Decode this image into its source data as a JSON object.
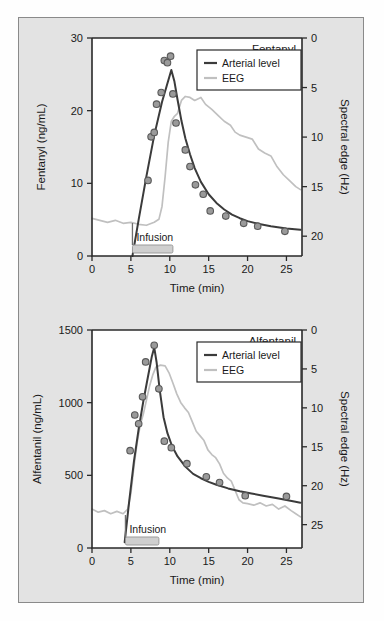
{
  "figure": {
    "background_color": "#e3e3e3",
    "frame_color": "#8a8a8a"
  },
  "colors": {
    "arterial": "#3b3b3b",
    "eeg": "#c0c0c0",
    "point_fill": "#9a9a9a",
    "point_stroke": "#595959",
    "infusion_bar": "#cfcfcf"
  },
  "chart_data": [
    {
      "type": "line",
      "title": "Fentanyl",
      "xlabel": "Time (min)",
      "ylabel": "Fentanyl (ng/mL)",
      "y2label": "Spectral edge (Hz)",
      "xlim": [
        0,
        27
      ],
      "ylim": [
        0,
        30
      ],
      "y2lim": [
        0,
        22
      ],
      "y2_inverted": true,
      "grid": false,
      "legend_position": "top-right",
      "xticks": [
        0,
        5,
        10,
        15,
        20,
        25
      ],
      "yticks": [
        0,
        10,
        20,
        30
      ],
      "y2ticks": [
        0,
        5,
        10,
        15,
        20
      ],
      "annotation": "Infusion",
      "infusion_start": 5.2,
      "infusion_end": 10.4,
      "series": [
        {
          "name": "Arterial level",
          "axis": "left",
          "style": "line",
          "points": [
            [
              5.2,
              0.0
            ],
            [
              6.0,
              5.0
            ],
            [
              7.0,
              11.0
            ],
            [
              8.0,
              16.6
            ],
            [
              9.0,
              21.2
            ],
            [
              9.6,
              23.4
            ],
            [
              10.2,
              25.6
            ],
            [
              10.6,
              24.0
            ],
            [
              11.0,
              21.5
            ],
            [
              11.5,
              18.6
            ],
            [
              12.0,
              16.2
            ],
            [
              12.6,
              14.0
            ],
            [
              13.2,
              12.1
            ],
            [
              14.0,
              10.2
            ],
            [
              15.0,
              8.5
            ],
            [
              16.0,
              7.3
            ],
            [
              17.0,
              6.4
            ],
            [
              18.0,
              5.7
            ],
            [
              19.0,
              5.2
            ],
            [
              20.0,
              4.8
            ],
            [
              21.5,
              4.4
            ],
            [
              23.0,
              4.1
            ],
            [
              25.0,
              3.8
            ],
            [
              26.8,
              3.6
            ]
          ]
        },
        {
          "name": "Arterial level (measured)",
          "axis": "left",
          "style": "scatter",
          "points": [
            [
              7.2,
              10.4
            ],
            [
              7.6,
              16.4
            ],
            [
              8.0,
              17.0
            ],
            [
              8.3,
              20.9
            ],
            [
              8.9,
              22.5
            ],
            [
              9.3,
              26.9
            ],
            [
              9.7,
              26.6
            ],
            [
              10.1,
              27.5
            ],
            [
              10.4,
              22.3
            ],
            [
              10.8,
              18.3
            ],
            [
              12.0,
              14.6
            ],
            [
              12.6,
              12.3
            ],
            [
              13.3,
              9.8
            ],
            [
              14.3,
              8.5
            ],
            [
              15.2,
              6.2
            ],
            [
              17.2,
              5.5
            ],
            [
              19.5,
              4.5
            ],
            [
              21.3,
              4.1
            ],
            [
              24.8,
              3.4
            ]
          ]
        },
        {
          "name": "EEG",
          "axis": "right",
          "style": "line",
          "points": [
            [
              0.0,
              18.2
            ],
            [
              1.0,
              18.4
            ],
            [
              2.0,
              18.6
            ],
            [
              3.0,
              18.4
            ],
            [
              4.0,
              18.7
            ],
            [
              5.0,
              18.6
            ],
            [
              6.0,
              18.8
            ],
            [
              7.0,
              18.9
            ],
            [
              8.0,
              18.6
            ],
            [
              8.6,
              18.3
            ],
            [
              9.0,
              17.0
            ],
            [
              9.4,
              14.0
            ],
            [
              9.8,
              10.5
            ],
            [
              10.2,
              8.4
            ],
            [
              10.6,
              7.9
            ],
            [
              11.0,
              7.6
            ],
            [
              11.5,
              6.3
            ],
            [
              12.0,
              5.9
            ],
            [
              12.6,
              6.0
            ],
            [
              13.2,
              6.3
            ],
            [
              14.0,
              6.0
            ],
            [
              14.6,
              6.7
            ],
            [
              15.4,
              7.2
            ],
            [
              16.2,
              7.8
            ],
            [
              17.0,
              8.4
            ],
            [
              17.8,
              8.8
            ],
            [
              18.4,
              9.5
            ],
            [
              19.0,
              9.8
            ],
            [
              19.8,
              10.0
            ],
            [
              20.6,
              10.2
            ],
            [
              21.4,
              11.2
            ],
            [
              22.2,
              11.6
            ],
            [
              23.0,
              11.9
            ],
            [
              23.8,
              13.0
            ],
            [
              24.6,
              13.8
            ],
            [
              25.4,
              14.4
            ],
            [
              26.2,
              15.0
            ],
            [
              26.8,
              15.3
            ]
          ]
        }
      ]
    },
    {
      "type": "line",
      "title": "Alfentanil",
      "xlabel": "Time (min)",
      "ylabel": "Alfentanil (ng/mL)",
      "y2label": "Spectral edge (Hz)",
      "xlim": [
        0,
        27
      ],
      "ylim": [
        0,
        1500
      ],
      "y2lim": [
        0,
        28
      ],
      "y2_inverted": true,
      "grid": false,
      "legend_position": "top-right",
      "xticks": [
        0,
        5,
        10,
        15,
        20,
        25
      ],
      "yticks": [
        0,
        500,
        1000,
        1500
      ],
      "y2ticks": [
        0,
        5,
        10,
        15,
        20,
        25
      ],
      "annotation": "Infusion",
      "infusion_start": 4.3,
      "infusion_end": 8.6,
      "series": [
        {
          "name": "Arterial level",
          "axis": "left",
          "style": "line",
          "points": [
            [
              4.2,
              40
            ],
            [
              4.8,
              330
            ],
            [
              5.4,
              600
            ],
            [
              6.0,
              820
            ],
            [
              6.6,
              1010
            ],
            [
              7.2,
              1180
            ],
            [
              7.7,
              1320
            ],
            [
              8.0,
              1380
            ],
            [
              8.3,
              1280
            ],
            [
              8.7,
              1090
            ],
            [
              9.2,
              900
            ],
            [
              9.7,
              790
            ],
            [
              10.3,
              700
            ],
            [
              11.0,
              630
            ],
            [
              12.0,
              560
            ],
            [
              13.0,
              510
            ],
            [
              14.0,
              480
            ],
            [
              15.0,
              455
            ],
            [
              16.0,
              435
            ],
            [
              17.5,
              410
            ],
            [
              19.0,
              390
            ],
            [
              20.5,
              375
            ],
            [
              22.0,
              360
            ],
            [
              24.0,
              340
            ],
            [
              26.0,
              320
            ],
            [
              26.8,
              312
            ]
          ]
        },
        {
          "name": "Arterial level (measured)",
          "axis": "left",
          "style": "scatter",
          "points": [
            [
              4.9,
              670
            ],
            [
              5.5,
              915
            ],
            [
              6.0,
              855
            ],
            [
              6.5,
              1040
            ],
            [
              6.9,
              1280
            ],
            [
              8.0,
              1395
            ],
            [
              8.6,
              1095
            ],
            [
              9.3,
              735
            ],
            [
              10.2,
              690
            ],
            [
              12.2,
              580
            ],
            [
              14.7,
              490
            ],
            [
              16.4,
              450
            ],
            [
              19.7,
              360
            ],
            [
              25.0,
              355
            ]
          ]
        },
        {
          "name": "EEG",
          "axis": "right",
          "style": "line",
          "points": [
            [
              0.0,
              23.0
            ],
            [
              0.8,
              23.4
            ],
            [
              1.6,
              23.2
            ],
            [
              2.4,
              23.6
            ],
            [
              3.2,
              23.3
            ],
            [
              4.0,
              23.6
            ],
            [
              4.6,
              23.0
            ],
            [
              5.0,
              21.0
            ],
            [
              5.4,
              17.5
            ],
            [
              5.8,
              14.5
            ],
            [
              6.2,
              12.2
            ],
            [
              6.6,
              10.8
            ],
            [
              7.0,
              9.0
            ],
            [
              7.4,
              7.2
            ],
            [
              7.8,
              5.8
            ],
            [
              8.2,
              4.8
            ],
            [
              8.8,
              4.5
            ],
            [
              9.4,
              4.6
            ],
            [
              9.9,
              5.5
            ],
            [
              10.4,
              6.8
            ],
            [
              10.9,
              8.2
            ],
            [
              11.4,
              9.3
            ],
            [
              11.9,
              10.0
            ],
            [
              12.4,
              10.6
            ],
            [
              12.9,
              11.8
            ],
            [
              13.4,
              13.0
            ],
            [
              13.9,
              13.6
            ],
            [
              14.4,
              14.2
            ],
            [
              14.9,
              15.4
            ],
            [
              15.4,
              16.0
            ],
            [
              15.9,
              16.4
            ],
            [
              16.4,
              17.2
            ],
            [
              16.9,
              18.4
            ],
            [
              17.4,
              19.0
            ],
            [
              17.9,
              19.4
            ],
            [
              18.4,
              20.6
            ],
            [
              18.9,
              21.8
            ],
            [
              19.4,
              22.2
            ],
            [
              20.0,
              22.3
            ],
            [
              20.8,
              22.5
            ],
            [
              21.6,
              22.2
            ],
            [
              22.4,
              22.6
            ],
            [
              23.2,
              22.4
            ],
            [
              24.0,
              23.0
            ],
            [
              24.8,
              22.6
            ],
            [
              25.6,
              23.2
            ],
            [
              26.2,
              23.6
            ],
            [
              26.8,
              24.0
            ]
          ]
        }
      ]
    }
  ],
  "legend": {
    "arterial_label": "Arterial level",
    "eeg_label": "EEG"
  }
}
